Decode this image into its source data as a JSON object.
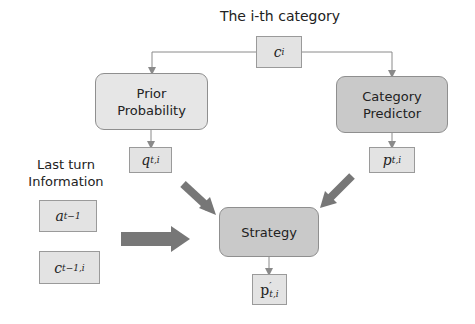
{
  "title": "The i-th category",
  "nodes": {
    "category_input": {
      "base": "c",
      "sub": "i",
      "sup": ""
    },
    "prior_probability": {
      "line1": "Prior",
      "line2": "Probability"
    },
    "category_predictor": {
      "line1": "Category",
      "line2": "Predictor"
    },
    "prior_output": {
      "base": "q",
      "sub": "t,i",
      "sup": ""
    },
    "predictor_output": {
      "base": "p",
      "sub": "t,i",
      "sup": ""
    },
    "last_turn_label": {
      "line1": "Last turn",
      "line2": "Information"
    },
    "last_action": {
      "base": "a",
      "sub": "t−1",
      "sup": ""
    },
    "last_category": {
      "base": "c",
      "sub": "t−1,i",
      "sup": ""
    },
    "strategy": {
      "label": "Strategy"
    },
    "strategy_output": {
      "base": "p",
      "sub": "t,i",
      "sup": "′"
    }
  },
  "colors": {
    "box_light": "#e6e6e6",
    "box_dark": "#c9c9c9",
    "arrow_thick": "#777777",
    "line_thin": "#8a8a8a"
  }
}
